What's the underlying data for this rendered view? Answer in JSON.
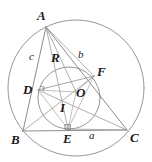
{
  "figure": {
    "type": "euclidean-geometry-diagram",
    "stroke_color": "#6e6e6e",
    "label_color": "#1a1a1a",
    "background": "#ffffff"
  },
  "points": {
    "A": {
      "label": "A",
      "x": 46,
      "y": 27,
      "label_x": 37,
      "label_y": 9
    },
    "B": {
      "label": "B",
      "x": 23,
      "y": 131,
      "label_x": 11,
      "label_y": 133
    },
    "C": {
      "label": "C",
      "x": 127,
      "y": 130,
      "label_x": 130,
      "label_y": 131
    },
    "D": {
      "label": "D",
      "x": 38,
      "y": 90,
      "label_x": 23,
      "label_y": 83
    },
    "E": {
      "label": "E",
      "x": 68,
      "y": 129,
      "label_x": 63,
      "label_y": 132
    },
    "F": {
      "label": "F",
      "x": 94,
      "y": 76,
      "label_x": 97,
      "label_y": 65
    },
    "O": {
      "label": "O",
      "x": 76,
      "y": 92,
      "label_x": 76,
      "label_y": 86
    },
    "I": {
      "label": "I",
      "x": 63,
      "y": 105,
      "label_x": 60,
      "label_y": 101
    }
  },
  "segment_labels": {
    "c": {
      "label": "c",
      "x": 29,
      "y": 51,
      "note": "side AB"
    },
    "b": {
      "label": "b",
      "x": 78,
      "y": 49,
      "note": "side AC"
    },
    "a": {
      "label": "a",
      "x": 89,
      "y": 130,
      "note": "side BC"
    },
    "R": {
      "label": "R",
      "x": 51,
      "y": 51,
      "note": "circumradius segment from A"
    }
  },
  "circumcircle": {
    "cx": 76,
    "cy": 88,
    "r": 68
  },
  "incircle": {
    "cx": 69,
    "cy": 98,
    "r": 31
  },
  "right_angle_markers": [
    {
      "at": "D",
      "x": 40,
      "y": 88
    },
    {
      "at": "E",
      "x": 66,
      "y": 123
    }
  ]
}
